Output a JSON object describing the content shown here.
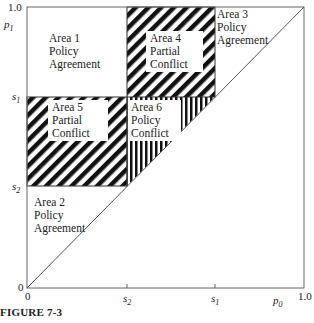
{
  "figure": {
    "caption": "FIGURE 7-3",
    "axes": {
      "x_label": "p0",
      "x_label_base": "p",
      "x_label_sub": "0",
      "y_label": "p1",
      "y_label_base": "p",
      "y_label_sub": "1",
      "x_ticks": [
        {
          "label_base": "s",
          "label_sub": "2",
          "value": 0.36
        },
        {
          "label_base": "s",
          "label_sub": "1",
          "value": 0.68
        }
      ],
      "y_ticks": [
        {
          "label_base": "s",
          "label_sub": "1",
          "value": 0.68
        },
        {
          "label_base": "s",
          "label_sub": "2",
          "value": 0.36
        }
      ],
      "x_origin": "0",
      "y_origin": "0",
      "x_max": "1.0",
      "y_max": "1.0"
    },
    "areas": [
      {
        "id": 1,
        "line1": "Area 1",
        "line2": "Policy",
        "line3": "Agreement",
        "fill": "none"
      },
      {
        "id": 2,
        "line1": "Area 2",
        "line2": "Policy",
        "line3": "Agreement",
        "fill": "none"
      },
      {
        "id": 3,
        "line1": "Area 3",
        "line2": "Policy",
        "line3": "Agreement",
        "fill": "none"
      },
      {
        "id": 4,
        "line1": "Area 4",
        "line2": "Partial",
        "line3": "Conflict",
        "fill": "diagonal-hatch"
      },
      {
        "id": 5,
        "line1": "Area 5",
        "line2": "Partial",
        "line3": "Conflict",
        "fill": "diagonal-hatch"
      },
      {
        "id": 6,
        "line1": "Area 6",
        "line2": "Policy",
        "line3": "Conflict",
        "fill": "vertical-hatch"
      }
    ],
    "colors": {
      "line": "#555555",
      "hatch": "#111111",
      "background": "#ffffff"
    }
  }
}
